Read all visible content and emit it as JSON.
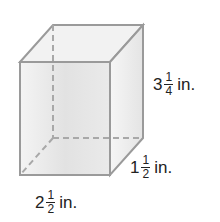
{
  "figure": {
    "type": "rectangular-prism",
    "colors": {
      "edge": "#9a9a9a",
      "face_front": "#e6e6e6",
      "face_side": "#ececec",
      "face_top": "#f0f0f0",
      "text": "#222222"
    }
  },
  "labels": {
    "height": {
      "whole": "3",
      "num": "1",
      "den": "4",
      "unit": "in."
    },
    "depth": {
      "whole": "1",
      "num": "1",
      "den": "2",
      "unit": "in."
    },
    "width": {
      "whole": "2",
      "num": "1",
      "den": "2",
      "unit": "in."
    }
  }
}
